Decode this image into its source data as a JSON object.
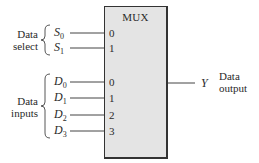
{
  "diagram": {
    "block": {
      "title": "MUX",
      "fill": "#e4e4e4",
      "border": "#333333"
    },
    "select": {
      "group_label_line1": "Data",
      "group_label_line2": "select",
      "signals": [
        {
          "name": "S",
          "sub": "0",
          "pin": "0"
        },
        {
          "name": "S",
          "sub": "1",
          "pin": "1"
        }
      ]
    },
    "inputs": {
      "group_label_line1": "Data",
      "group_label_line2": "inputs",
      "signals": [
        {
          "name": "D",
          "sub": "0",
          "pin": "0"
        },
        {
          "name": "D",
          "sub": "1",
          "pin": "1"
        },
        {
          "name": "D",
          "sub": "2",
          "pin": "2"
        },
        {
          "name": "D",
          "sub": "3",
          "pin": "3"
        }
      ]
    },
    "output": {
      "signal": "Y",
      "label_line1": "Data",
      "label_line2": "output"
    }
  }
}
